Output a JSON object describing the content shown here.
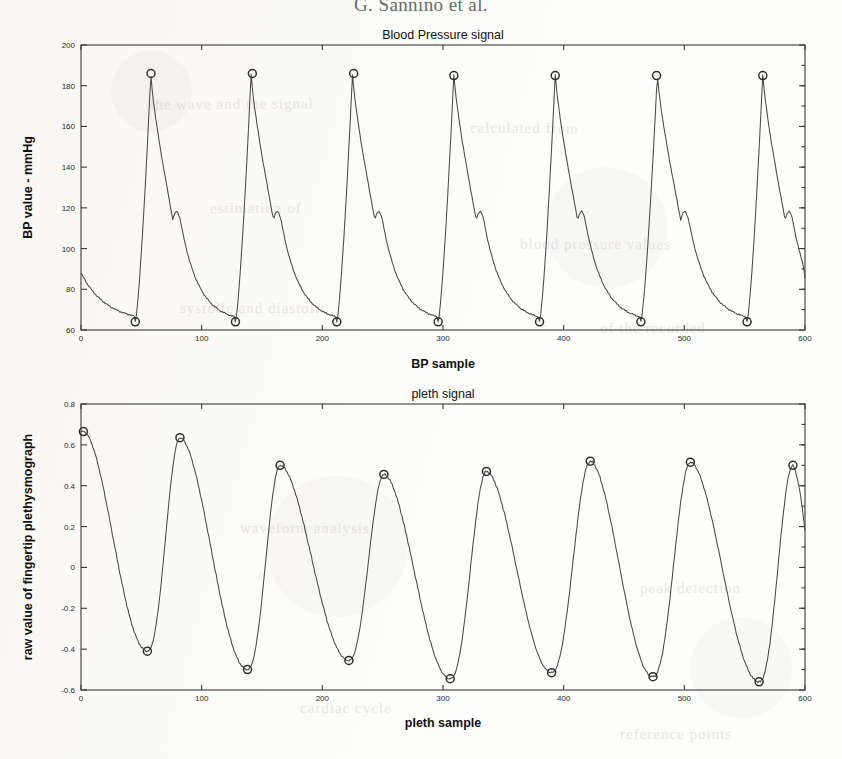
{
  "page": {
    "running_head": "G. Sannino et al.",
    "bleed_through": [
      {
        "text": "the wave and the signal",
        "x": 150,
        "y": 96,
        "rot": -0.4
      },
      {
        "text": "calculated from",
        "x": 470,
        "y": 120,
        "rot": 0.3
      },
      {
        "text": "estimation of",
        "x": 210,
        "y": 200,
        "rot": -0.2
      },
      {
        "text": "blood pressure values",
        "x": 520,
        "y": 236,
        "rot": 0.2
      },
      {
        "text": "systolic and diastolic",
        "x": 180,
        "y": 300,
        "rot": 0.1
      },
      {
        "text": "of the recorded",
        "x": 600,
        "y": 320,
        "rot": -0.3
      },
      {
        "text": "waveform analysis",
        "x": 240,
        "y": 520,
        "rot": 0.2
      },
      {
        "text": "peak detection",
        "x": 640,
        "y": 580,
        "rot": -0.2
      },
      {
        "text": "cardiac cycle",
        "x": 300,
        "y": 700,
        "rot": 0.3
      },
      {
        "text": "reference points",
        "x": 620,
        "y": 726,
        "rot": -0.1
      }
    ]
  },
  "chart_data": [
    {
      "id": "bp",
      "type": "line",
      "title": "Blood Pressure signal",
      "xlabel": "BP sample",
      "ylabel": "BP value - mmHg",
      "xlim": [
        0,
        600
      ],
      "ylim": [
        60,
        200
      ],
      "xticks": [
        0,
        100,
        200,
        300,
        400,
        500,
        600
      ],
      "xticklabels": [
        "0",
        "100",
        "200",
        "300",
        "400",
        "500",
        "600"
      ],
      "yticks": [
        60,
        80,
        100,
        120,
        140,
        160,
        180,
        200
      ],
      "yticklabels": [
        "60",
        "80",
        "100",
        "120",
        "140",
        "160",
        "180",
        "200"
      ],
      "grid": false,
      "legend": "none",
      "series": [
        {
          "name": "Blood Pressure signal",
          "units": "mmHg",
          "marker": "circle",
          "beat_period": 84,
          "beat_onsets": [
            45,
            128,
            212,
            296,
            380,
            464,
            552
          ],
          "systolic_peaks_x": [
            58,
            142,
            226,
            309,
            393,
            477,
            565
          ],
          "systolic_peak_value": 186,
          "diastolic_min_value": 64,
          "start_value": 88,
          "end_value": 83,
          "marked_minima": [
            {
              "x": 45,
              "y": 64
            },
            {
              "x": 128,
              "y": 64
            },
            {
              "x": 212,
              "y": 64
            },
            {
              "x": 296,
              "y": 64
            },
            {
              "x": 380,
              "y": 64
            },
            {
              "x": 464,
              "y": 64
            },
            {
              "x": 552,
              "y": 64
            }
          ],
          "marked_maxima": [
            {
              "x": 58,
              "y": 186
            },
            {
              "x": 142,
              "y": 186
            },
            {
              "x": 226,
              "y": 186
            },
            {
              "x": 309,
              "y": 185
            },
            {
              "x": 393,
              "y": 185
            },
            {
              "x": 477,
              "y": 185
            },
            {
              "x": 565,
              "y": 185
            }
          ]
        }
      ]
    },
    {
      "id": "pleth",
      "type": "line",
      "title": "pleth signal",
      "xlabel": "pleth sample",
      "ylabel": "raw value of fingertip plethysmograph",
      "xlim": [
        0,
        600
      ],
      "ylim": [
        -0.6,
        0.8
      ],
      "xticks": [
        0,
        100,
        200,
        300,
        400,
        500,
        600
      ],
      "xticklabels": [
        "0",
        "100",
        "200",
        "300",
        "400",
        "500",
        "600"
      ],
      "yticks": [
        -0.6,
        -0.4,
        -0.2,
        0,
        0.2,
        0.4,
        0.6,
        0.8
      ],
      "yticklabels": [
        "-0.6",
        "-0.4",
        "-0.2",
        "0",
        "0.2",
        "0.4",
        "0.6",
        "0.8"
      ],
      "grid": false,
      "legend": "none",
      "series": [
        {
          "name": "pleth signal",
          "units": "normalized",
          "marker": "circle",
          "marked_maxima": [
            {
              "x": 2,
              "y": 0.665
            },
            {
              "x": 82,
              "y": 0.635
            },
            {
              "x": 165,
              "y": 0.5
            },
            {
              "x": 251,
              "y": 0.455
            },
            {
              "x": 336,
              "y": 0.47
            },
            {
              "x": 422,
              "y": 0.52
            },
            {
              "x": 505,
              "y": 0.515
            },
            {
              "x": 590,
              "y": 0.5
            }
          ],
          "marked_minima": [
            {
              "x": 55,
              "y": -0.41
            },
            {
              "x": 138,
              "y": -0.5
            },
            {
              "x": 222,
              "y": -0.455
            },
            {
              "x": 306,
              "y": -0.545
            },
            {
              "x": 390,
              "y": -0.515
            },
            {
              "x": 474,
              "y": -0.535
            },
            {
              "x": 562,
              "y": -0.56
            }
          ]
        }
      ]
    }
  ]
}
